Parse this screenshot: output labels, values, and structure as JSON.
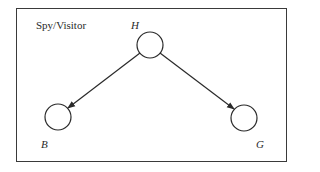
{
  "diagram": {
    "title": "Spy/Visitor",
    "nodes": [
      {
        "id": "H",
        "label": "H"
      },
      {
        "id": "B",
        "label": "B"
      },
      {
        "id": "G",
        "label": "G"
      }
    ],
    "edges": [
      {
        "from": "H",
        "to": "B"
      },
      {
        "from": "H",
        "to": "G"
      }
    ]
  }
}
